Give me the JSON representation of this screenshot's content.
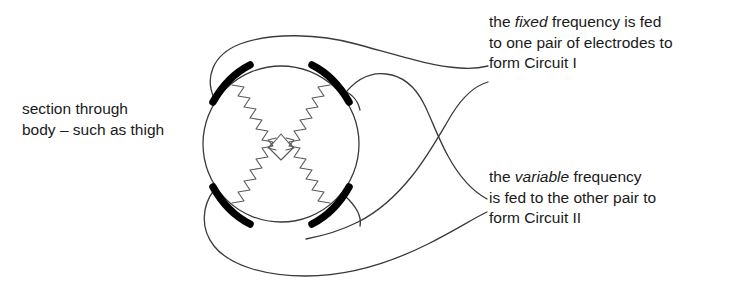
{
  "figure": {
    "colors": {
      "ink": "#1a1a1a",
      "line": "#3a3a3a",
      "electrode": "#000000",
      "wave": "#5a5a5a",
      "background": "#ffffff"
    }
  },
  "labels": {
    "section": {
      "line1": "section through",
      "line2": "body – such as thigh"
    },
    "fixed": {
      "line1_prefix": "the ",
      "line1_emphasis": "fixed",
      "line1_suffix": " frequency is fed",
      "line2": "to one pair of electrodes to",
      "line3": "form Circuit I"
    },
    "variable": {
      "line1_prefix": "the ",
      "line1_emphasis": "variable",
      "line1_suffix": " frequency",
      "line2": "is fed to the other pair to",
      "line3": "form Circuit II"
    }
  },
  "diagram": {
    "body_section": {
      "shape": "circle",
      "cx": 281,
      "cy": 144,
      "r": 78
    },
    "electrodes": [
      {
        "name": "electrode-top-left",
        "x1": 212,
        "y1": 103,
        "x2": 249,
        "y2": 64
      },
      {
        "name": "electrode-top-right",
        "x1": 313,
        "y1": 63,
        "x2": 350,
        "y2": 103
      },
      {
        "name": "electrode-bottom-left",
        "x1": 212,
        "y1": 186,
        "x2": 249,
        "y2": 225
      },
      {
        "name": "electrode-bottom-right",
        "x1": 313,
        "y1": 226,
        "x2": 350,
        "y2": 186
      }
    ],
    "wave_count": 4,
    "cables": [
      {
        "name": "cable-circuit-one-upper",
        "to_label": "fixed"
      },
      {
        "name": "cable-circuit-one-lower",
        "to_label": "fixed"
      },
      {
        "name": "cable-circuit-two-upper",
        "to_label": "variable"
      },
      {
        "name": "cable-circuit-two-lower",
        "to_label": "variable"
      }
    ]
  }
}
